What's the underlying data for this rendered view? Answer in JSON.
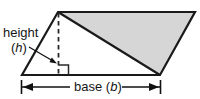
{
  "figure": {
    "type": "geometry-diagram",
    "shape": "parallelogram",
    "labels": {
      "height_text": "height",
      "height_var_open": "(",
      "height_var": "h",
      "height_var_close": ")",
      "base_text": "base",
      "base_var_open": "(",
      "base_var": "b",
      "base_var_close": ")"
    },
    "colors": {
      "outline": "#1a1a1a",
      "shaded_triangle_fill": "#d6d6d6",
      "unshaded_fill": "#ffffff",
      "background": "#ffffff",
      "text": "#161616",
      "dashed_line": "#2a2a2a",
      "dimension_line": "#111111"
    },
    "geometry": {
      "parallelogram_vertices": [
        {
          "name": "top-left-apex",
          "x": 58,
          "y": 12
        },
        {
          "name": "top-right",
          "x": 195,
          "y": 12
        },
        {
          "name": "bottom-right",
          "x": 160,
          "y": 75
        },
        {
          "name": "bottom-left",
          "x": 22,
          "y": 75
        }
      ],
      "height_segment": {
        "x1": 58,
        "y1": 12,
        "x2": 58,
        "y2": 75,
        "style": "dashed"
      },
      "diagonal": {
        "x1": 58,
        "y1": 12,
        "x2": 160,
        "y2": 75
      },
      "right_angle_marker": {
        "x": 58,
        "y": 65,
        "size": 10
      },
      "shaded_triangle": [
        {
          "x": 58,
          "y": 12
        },
        {
          "x": 195,
          "y": 12
        },
        {
          "x": 160,
          "y": 75
        }
      ],
      "height_arrow": {
        "x1": 30,
        "y1": 48,
        "x2": 56,
        "y2": 62
      },
      "base_dimension": {
        "y": 87,
        "x_left": 21,
        "x_right": 160
      }
    }
  }
}
